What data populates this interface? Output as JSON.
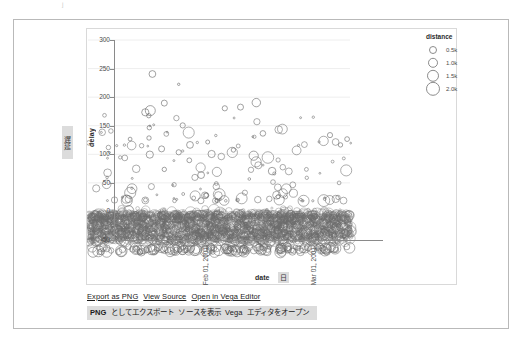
{
  "window": {
    "artifact_mark": "ʲ"
  },
  "chart_data": {
    "type": "scatter",
    "title": "",
    "xlabel": "date",
    "ylabel": "delay",
    "ylim": [
      -50,
      300
    ],
    "ytick_labels": [
      "300",
      "250",
      "200",
      "150",
      "100",
      "50",
      "0",
      "-50"
    ],
    "ytick_values": [
      300,
      250,
      200,
      150,
      100,
      50,
      0,
      -50
    ],
    "xtick_labels": [
      "Feb 01, 2001",
      "Mar 01, 2001"
    ],
    "xtick_values": [
      0.345,
      0.755
    ],
    "grid": true,
    "size_encoding": "distance",
    "legend": {
      "title": "distance",
      "position": "right",
      "entries": [
        {
          "label": "0.5k",
          "value": 500,
          "radius": 3.0
        },
        {
          "label": "1.0k",
          "value": 1000,
          "radius": 4.2
        },
        {
          "label": "1.5k",
          "value": 1500,
          "radius": 5.2
        },
        {
          "label": "2.0k",
          "value": 2000,
          "radius": 6.2
        }
      ]
    },
    "marker": {
      "shape": "circle",
      "filled": false,
      "stroke": "#6b6b6b",
      "stroke_width": 0.7,
      "opacity": 0.75
    },
    "point_count_approx": 3000,
    "notable_points": [
      {
        "x": 0.245,
        "y": 272,
        "r": 3.4
      },
      {
        "x": 0.345,
        "y": 254,
        "r": 1.2
      },
      {
        "x": 0.29,
        "y": 221,
        "r": 3.0
      },
      {
        "x": 0.64,
        "y": 222,
        "r": 4.2
      },
      {
        "x": 0.237,
        "y": 208,
        "r": 5.0
      },
      {
        "x": 0.218,
        "y": 205,
        "r": 3.6
      },
      {
        "x": 0.231,
        "y": 199,
        "r": 2.2
      },
      {
        "x": 0.52,
        "y": 212,
        "r": 2.6
      },
      {
        "x": 0.58,
        "y": 214,
        "r": 3.0
      },
      {
        "x": 0.36,
        "y": 182,
        "r": 2.6
      },
      {
        "x": 0.233,
        "y": 178,
        "r": 2.2
      },
      {
        "x": 0.665,
        "y": 168,
        "r": 2.8
      },
      {
        "x": 0.16,
        "y": 158,
        "r": 1.9
      },
      {
        "x": 0.92,
        "y": 165,
        "r": 2.6
      },
      {
        "x": 0.985,
        "y": 158,
        "r": 2.4
      },
      {
        "x": 0.96,
        "y": 148,
        "r": 2.2
      },
      {
        "x": 0.232,
        "y": 160,
        "r": 2.2
      },
      {
        "x": 0.388,
        "y": 148,
        "r": 3.4
      },
      {
        "x": 0.455,
        "y": 153,
        "r": 2.0
      },
      {
        "x": 0.28,
        "y": 141,
        "r": 3.0
      },
      {
        "x": 0.235,
        "y": 131,
        "r": 3.6
      },
      {
        "x": 0.345,
        "y": 135,
        "r": 2.6
      },
      {
        "x": 0.47,
        "y": 132,
        "r": 3.6
      },
      {
        "x": 0.63,
        "y": 129,
        "r": 4.6
      },
      {
        "x": 0.553,
        "y": 139,
        "r": 2.2
      },
      {
        "x": 0.385,
        "y": 121,
        "r": 2.4
      },
      {
        "x": 0.29,
        "y": 105,
        "r": 2.2
      },
      {
        "x": 0.43,
        "y": 95,
        "r": 3.4
      },
      {
        "x": 0.7,
        "y": 102,
        "r": 3.8
      }
    ]
  },
  "axis_titles": {
    "y_jp": "遅延",
    "x_jp": "日"
  },
  "links": {
    "en": [
      {
        "label": "Export as PNG",
        "name": "export-png-link"
      },
      {
        "label": "View Source",
        "name": "view-source-link"
      },
      {
        "label": "Open in Vega Editor",
        "name": "open-vega-editor-link"
      }
    ],
    "jp_tokens": [
      {
        "text": "PNG",
        "highlight": true
      },
      {
        "text": "としてエクスポート",
        "highlight": false
      },
      {
        "text": "ソースを表示",
        "highlight": false
      },
      {
        "text": "Vega",
        "highlight": false
      },
      {
        "text": "エディタをオープン",
        "highlight": false
      }
    ]
  },
  "colors": {
    "frame": "#b9b9b9",
    "view_border": "#d9d9d9",
    "axis": "#8a8a8a",
    "grid": "#eeeeee",
    "marker": "#6b6b6b",
    "jp_highlight": "#dcdcdc",
    "text": "#2b2b2b"
  }
}
